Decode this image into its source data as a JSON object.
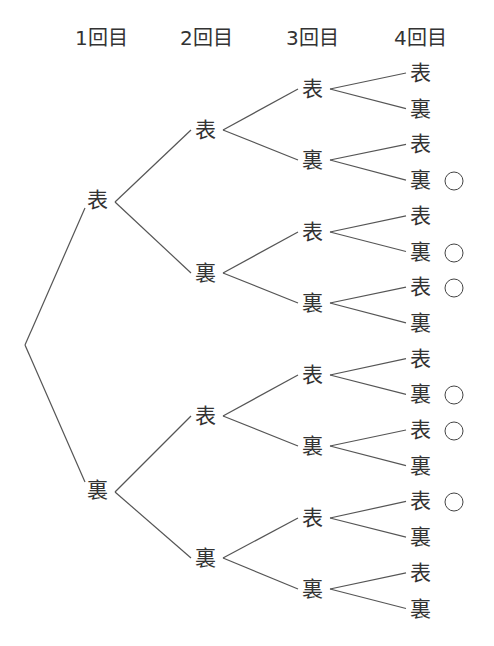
{
  "headers": [
    "1回目",
    "2回目",
    "3回目",
    "4回目"
  ],
  "colors": {
    "line": "#555555",
    "text": "#333333",
    "background": "#ffffff"
  },
  "tree": {
    "root": {
      "x": 25,
      "y": 345
    },
    "level1": [
      {
        "label": "表",
        "x": 97,
        "y": 200
      },
      {
        "label": "裏",
        "x": 97,
        "y": 490
      }
    ],
    "level2": [
      {
        "label": "表",
        "x": 205,
        "y": 130
      },
      {
        "label": "裏",
        "x": 205,
        "y": 273
      },
      {
        "label": "表",
        "x": 205,
        "y": 416
      },
      {
        "label": "裏",
        "x": 205,
        "y": 558
      }
    ],
    "level3": [
      {
        "label": "表",
        "x": 312,
        "y": 89
      },
      {
        "label": "裏",
        "x": 312,
        "y": 160
      },
      {
        "label": "表",
        "x": 312,
        "y": 232
      },
      {
        "label": "裏",
        "x": 312,
        "y": 303
      },
      {
        "label": "表",
        "x": 312,
        "y": 375
      },
      {
        "label": "裏",
        "x": 312,
        "y": 446
      },
      {
        "label": "表",
        "x": 312,
        "y": 518
      },
      {
        "label": "裏",
        "x": 312,
        "y": 589
      }
    ],
    "level4": [
      {
        "label": "表",
        "marked": false
      },
      {
        "label": "裏",
        "marked": false
      },
      {
        "label": "表",
        "marked": false
      },
      {
        "label": "裏",
        "marked": true
      },
      {
        "label": "表",
        "marked": false
      },
      {
        "label": "裏",
        "marked": true
      },
      {
        "label": "表",
        "marked": true
      },
      {
        "label": "裏",
        "marked": false
      },
      {
        "label": "表",
        "marked": false
      },
      {
        "label": "裏",
        "marked": true
      },
      {
        "label": "表",
        "marked": true
      },
      {
        "label": "裏",
        "marked": false
      },
      {
        "label": "表",
        "marked": true
      },
      {
        "label": "裏",
        "marked": false
      },
      {
        "label": "表",
        "marked": false
      },
      {
        "label": "裏",
        "marked": false
      }
    ],
    "level4_layout": {
      "x": 420,
      "y_start": 73,
      "y_step": 35.7
    },
    "mark_symbol": "○"
  }
}
